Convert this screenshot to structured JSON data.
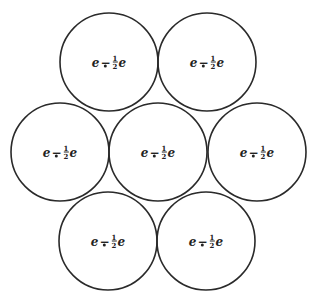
{
  "diagram": {
    "type": "hexagonal-circle-packing",
    "stroke_color": "#2a2a2a",
    "background": "#ffffff",
    "radius": 49,
    "circles": [
      {
        "id": "top-left",
        "cx": 109,
        "cy": 62,
        "label": {
          "left": "e",
          "op": "−",
          "num": "1",
          "den": "2",
          "right": "e"
        }
      },
      {
        "id": "top-right",
        "cx": 207,
        "cy": 62,
        "label": {
          "left": "e",
          "op": "−",
          "num": "1",
          "den": "2",
          "right": "e"
        }
      },
      {
        "id": "middle-left",
        "cx": 60,
        "cy": 152,
        "label": {
          "left": "e",
          "op": "−",
          "num": "1",
          "den": "2",
          "right": "e"
        }
      },
      {
        "id": "middle-center",
        "cx": 158,
        "cy": 152,
        "label": {
          "left": "e",
          "op": "−",
          "num": "1",
          "den": "2",
          "right": "e"
        }
      },
      {
        "id": "middle-right",
        "cx": 257,
        "cy": 152,
        "label": {
          "left": "e",
          "op": "−",
          "num": "1",
          "den": "2",
          "right": "e"
        }
      },
      {
        "id": "bottom-left",
        "cx": 108,
        "cy": 241,
        "label": {
          "left": "e",
          "op": "−",
          "num": "1",
          "den": "2",
          "right": "e"
        }
      },
      {
        "id": "bottom-right",
        "cx": 206,
        "cy": 241,
        "label": {
          "left": "e",
          "op": "−",
          "num": "1",
          "den": "2",
          "right": "e"
        }
      }
    ]
  }
}
